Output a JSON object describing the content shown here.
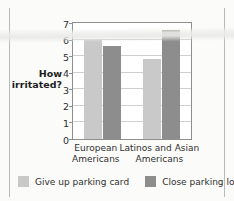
{
  "chart_data": {
    "type": "bar",
    "title": "",
    "xlabel": "",
    "ylabel": "How irritated?",
    "ylim": [
      0,
      7
    ],
    "yticks": [
      "0",
      "1",
      "2",
      "3",
      "4",
      "5",
      "6",
      "7"
    ],
    "grid": true,
    "legend_position": "bottom",
    "categories": [
      "European Americans",
      "Latinos and Asian Americans"
    ],
    "category_lines": [
      [
        "European",
        "Americans"
      ],
      [
        "Latinos and Asian",
        "Americans"
      ]
    ],
    "series": [
      {
        "name": "Give up parking card",
        "color": "#c9c9c9",
        "values": [
          6.0,
          4.8
        ]
      },
      {
        "name": "Close parking lot",
        "color": "#8d8d8d",
        "values": [
          5.6,
          6.6
        ]
      }
    ]
  },
  "axis": {
    "title_lines": [
      "How",
      "irritated?"
    ]
  },
  "legend": {
    "items": [
      {
        "label": "Give up parking card",
        "swatch": "light"
      },
      {
        "label": "Close parking lot",
        "swatch": "dark"
      }
    ]
  }
}
